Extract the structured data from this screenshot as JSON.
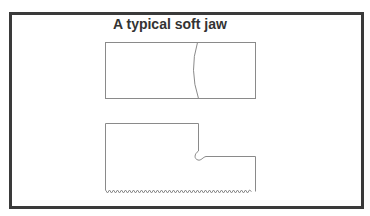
{
  "title": "A typical soft jaw",
  "colors": {
    "frame": "#3a3a3a",
    "outline": "#8a8a8a",
    "text": "#333333",
    "background": "#ffffff"
  },
  "figures": [
    {
      "name": "top-view",
      "description": "Rectangular soft jaw top view with curved contour line"
    },
    {
      "name": "side-view",
      "description": "Stepped soft jaw side view with relief notch and serrated bottom edge"
    }
  ]
}
